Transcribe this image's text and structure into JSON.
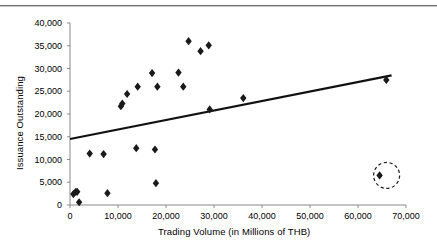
{
  "figure": {
    "divider": "horizontal-rule"
  },
  "chart_data": {
    "type": "scatter",
    "title": "",
    "xlabel": "Trading Volume (in Millions of THB)",
    "ylabel": "Issuance Outstanding",
    "xlim": [
      0,
      70000
    ],
    "ylim": [
      0,
      40000
    ],
    "xticks": [
      0,
      10000,
      20000,
      30000,
      40000,
      50000,
      60000,
      70000
    ],
    "yticks": [
      0,
      5000,
      10000,
      15000,
      20000,
      25000,
      30000,
      35000,
      40000
    ],
    "xticklabels": [
      "0",
      "10,000",
      "20,000",
      "30,000",
      "40,000",
      "50,000",
      "60,000",
      "70,000"
    ],
    "yticklabels": [
      "0",
      "5,000",
      "10,000",
      "15,000",
      "20,000",
      "25,000",
      "30,000",
      "35,000",
      "40,000"
    ],
    "grid": false,
    "legend": null,
    "marker": "diamond",
    "marker_color": "#1a1a1a",
    "points": [
      {
        "x": 700,
        "y": 2400
      },
      {
        "x": 1200,
        "y": 2900
      },
      {
        "x": 1500,
        "y": 2900
      },
      {
        "x": 1900,
        "y": 600
      },
      {
        "x": 4100,
        "y": 11300
      },
      {
        "x": 7000,
        "y": 11200
      },
      {
        "x": 7800,
        "y": 2600
      },
      {
        "x": 10600,
        "y": 21700
      },
      {
        "x": 10900,
        "y": 22300
      },
      {
        "x": 11900,
        "y": 24400
      },
      {
        "x": 13800,
        "y": 12500
      },
      {
        "x": 14100,
        "y": 26000
      },
      {
        "x": 17100,
        "y": 29000
      },
      {
        "x": 17700,
        "y": 12200
      },
      {
        "x": 17900,
        "y": 4800
      },
      {
        "x": 18200,
        "y": 26000
      },
      {
        "x": 22600,
        "y": 29100
      },
      {
        "x": 23600,
        "y": 26000
      },
      {
        "x": 24700,
        "y": 36000
      },
      {
        "x": 27200,
        "y": 33800
      },
      {
        "x": 28900,
        "y": 35100
      },
      {
        "x": 29100,
        "y": 21000
      },
      {
        "x": 36100,
        "y": 23500
      },
      {
        "x": 64500,
        "y": 6500,
        "highlighted": true
      },
      {
        "x": 65900,
        "y": 27500
      }
    ],
    "trendline": {
      "type": "linear",
      "x_start": 0,
      "y_start": 14500,
      "x_end": 67000,
      "y_end": 28500
    },
    "annotation": {
      "type": "dashed-circle",
      "label": "outlier-highlight",
      "center_x": 64500,
      "center_y": 6500,
      "radius_px": 13
    }
  }
}
